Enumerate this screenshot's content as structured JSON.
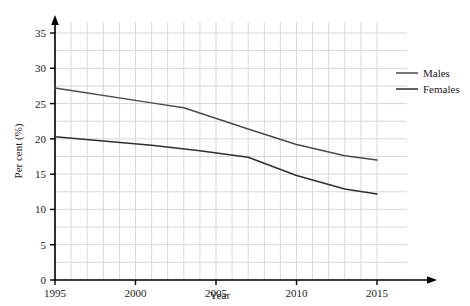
{
  "chart_data": {
    "type": "line",
    "title": "",
    "xlabel": "Year",
    "ylabel": "Per cent (%)",
    "xlim": [
      1995,
      2016
    ],
    "ylim": [
      0,
      37
    ],
    "xticks": [
      1995,
      2000,
      2005,
      2010,
      2015
    ],
    "yticks": [
      0,
      5,
      10,
      15,
      20,
      25,
      30,
      35
    ],
    "xtick_labels": [
      "1995",
      "2000",
      "2005",
      "2010",
      "2015"
    ],
    "ytick_labels": [
      "0",
      "5",
      "10",
      "15",
      "20",
      "25",
      "30",
      "35"
    ],
    "grid": true,
    "grid_x_step": 1,
    "grid_y_step": 2.5,
    "legend_position": "right",
    "series": [
      {
        "name": "Males",
        "color": "#4a4a4a",
        "x": [
          1995,
          2001,
          2003,
          2007,
          2010,
          2013,
          2015
        ],
        "values": [
          27.2,
          25.1,
          24.4,
          21.4,
          19.2,
          17.6,
          17.0
        ]
      },
      {
        "name": "Females",
        "color": "#2f2f2f",
        "x": [
          1995,
          2001,
          2004,
          2007,
          2010,
          2013,
          2015
        ],
        "values": [
          20.3,
          19.1,
          18.3,
          17.4,
          14.8,
          12.9,
          12.2
        ]
      }
    ]
  },
  "axes": {
    "x_title": "Year",
    "y_title": "Per cent (%)"
  },
  "legend": {
    "entries": [
      {
        "label": "Males"
      },
      {
        "label": "Females"
      }
    ]
  },
  "colors": {
    "males_line": "#4a4a4a",
    "females_line": "#2f2f2f",
    "grid": "#d9d9d9",
    "axis": "#000000",
    "background": "#ffffff"
  }
}
